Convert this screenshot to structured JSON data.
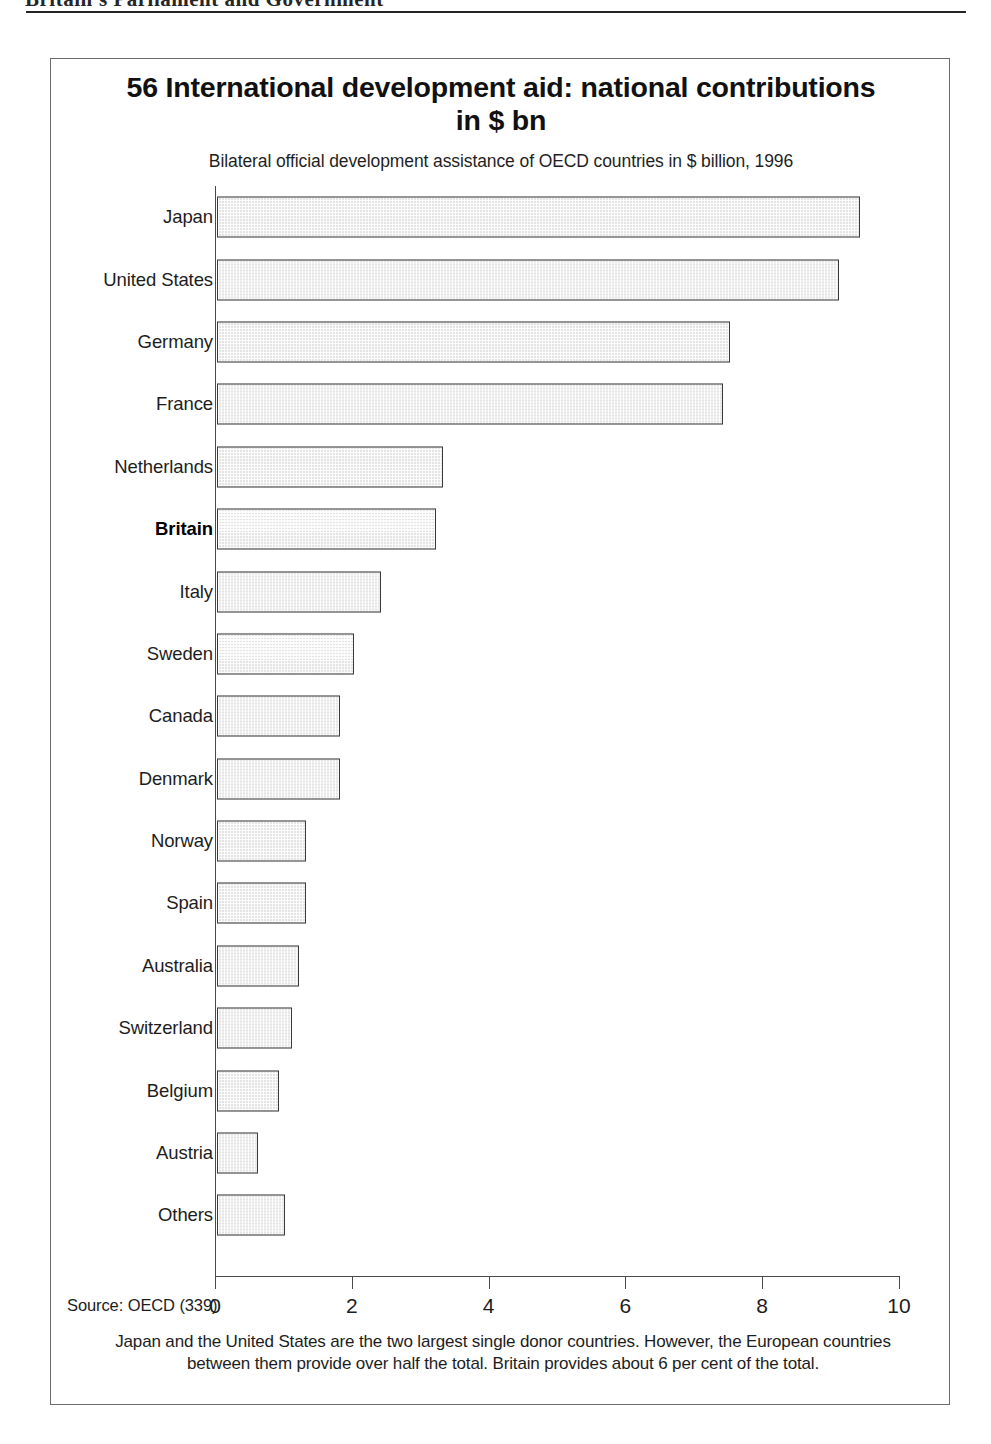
{
  "page_header": {
    "running_head": "Britain's Parliament and Government",
    "rule": "horizontal-rule"
  },
  "chart_panel": {
    "figure_number": "56",
    "title": "56 International development aid: national contributions in $ bn",
    "subtitle": "Bilateral official development assistance of OECD countries in $ billion, 1996",
    "source": "Source: OECD (339)",
    "caption": "Japan and the United States are the two largest single donor countries. However, the European countries between them provide over half the total. Britain provides about 6 per cent of the total.",
    "highlight_category": "Britain",
    "bar_fill_color": "#e4e4e4",
    "bar_border_color": "#3a3a3a",
    "axis_color": "#4a4a4a"
  },
  "chart_data": {
    "type": "bar",
    "orientation": "horizontal",
    "title": "56 International development aid: national contributions in $ bn",
    "subtitle": "Bilateral official development assistance of OECD countries in $ billion, 1996",
    "xlabel": "",
    "ylabel": "",
    "xlim": [
      0,
      10
    ],
    "xticks": [
      0,
      2,
      4,
      6,
      8,
      10
    ],
    "xtick_labels": [
      "0",
      "2",
      "4",
      "6",
      "8",
      "10"
    ],
    "grid": false,
    "legend": false,
    "units": "$ billion",
    "year": 1996,
    "categories": [
      "Japan",
      "United States",
      "Germany",
      "France",
      "Netherlands",
      "Britain",
      "Italy",
      "Sweden",
      "Canada",
      "Denmark",
      "Norway",
      "Spain",
      "Australia",
      "Switzerland",
      "Belgium",
      "Austria",
      "Others"
    ],
    "values": [
      9.4,
      9.1,
      7.5,
      7.4,
      3.3,
      3.2,
      2.4,
      2.0,
      1.8,
      1.8,
      1.3,
      1.3,
      1.2,
      1.1,
      0.9,
      0.6,
      1.0
    ]
  }
}
